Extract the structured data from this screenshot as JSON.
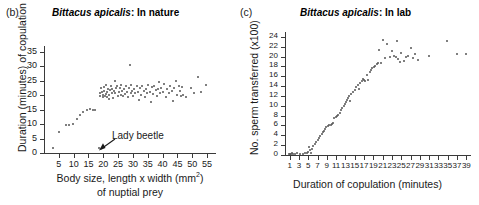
{
  "figure": {
    "background": "#ffffff",
    "point_color": "#555555",
    "axis_color": "#3a3a3a"
  },
  "panels": [
    {
      "letter": "(b)",
      "title_species": "Bittacus apicalis",
      "title_rest": ": In nature",
      "annotation": {
        "label": "Lady beetle",
        "points_to_x": 18.5,
        "points_to_y": 1.8
      }
    },
    {
      "letter": "(c)",
      "title_species": "Bittacus apicalis",
      "title_rest": ": In lab"
    }
  ],
  "chart_data": [
    {
      "type": "scatter",
      "panel": "(b)",
      "title": "Bittacus apicalis: In nature",
      "xlabel": "Body size, length x width (mm2) of nuptial prey",
      "xlabel_line1": "Body size, length x width (mm",
      "xlabel_line1_sup": "2",
      "xlabel_line1_end": ")",
      "xlabel_line2": "of nuptial prey",
      "ylabel": "Duration (minutes) of copulation",
      "xlim": [
        0,
        58
      ],
      "ylim": [
        0,
        37
      ],
      "xticks": [
        5,
        10,
        15,
        20,
        25,
        30,
        35,
        40,
        45,
        50,
        55
      ],
      "yticks": [
        0,
        5,
        10,
        15,
        20,
        25,
        30,
        35
      ],
      "grid": false,
      "legend": "none",
      "points": [
        [
          3.0,
          1.6
        ],
        [
          5.0,
          7.2
        ],
        [
          7.5,
          9.6
        ],
        [
          8.5,
          9.8
        ],
        [
          9.8,
          10.2
        ],
        [
          11.0,
          11.8
        ],
        [
          12.0,
          13.0
        ],
        [
          13.2,
          14.2
        ],
        [
          14.5,
          15.0
        ],
        [
          15.5,
          15.2
        ],
        [
          16.5,
          14.8
        ],
        [
          17.2,
          15.0
        ],
        [
          18.5,
          1.8
        ],
        [
          18.8,
          19.6
        ],
        [
          19.0,
          20.8
        ],
        [
          19.3,
          22.4
        ],
        [
          19.5,
          21.0
        ],
        [
          19.8,
          19.2
        ],
        [
          20.0,
          20.2
        ],
        [
          20.2,
          21.6
        ],
        [
          20.4,
          22.8
        ],
        [
          20.6,
          19.8
        ],
        [
          20.8,
          20.4
        ],
        [
          21.0,
          23.4
        ],
        [
          21.2,
          21.2
        ],
        [
          21.4,
          19.4
        ],
        [
          21.6,
          22.0
        ],
        [
          21.8,
          20.0
        ],
        [
          22.0,
          18.6
        ],
        [
          22.2,
          21.8
        ],
        [
          22.5,
          23.0
        ],
        [
          22.8,
          20.6
        ],
        [
          23.0,
          22.2
        ],
        [
          23.2,
          19.0
        ],
        [
          23.5,
          21.4
        ],
        [
          23.8,
          24.8
        ],
        [
          24.0,
          20.8
        ],
        [
          24.3,
          22.6
        ],
        [
          24.6,
          23.2
        ],
        [
          24.9,
          19.6
        ],
        [
          25.2,
          21.0
        ],
        [
          25.5,
          22.4
        ],
        [
          25.8,
          20.2
        ],
        [
          26.0,
          23.6
        ],
        [
          26.3,
          21.6
        ],
        [
          26.6,
          19.8
        ],
        [
          27.0,
          22.0
        ],
        [
          27.3,
          20.4
        ],
        [
          27.6,
          23.0
        ],
        [
          28.0,
          21.2
        ],
        [
          28.3,
          19.2
        ],
        [
          28.6,
          22.6
        ],
        [
          29.0,
          30.4
        ],
        [
          29.2,
          20.8
        ],
        [
          29.5,
          23.4
        ],
        [
          29.8,
          21.4
        ],
        [
          30.0,
          19.6
        ],
        [
          30.4,
          22.2
        ],
        [
          30.8,
          20.6
        ],
        [
          31.2,
          23.0
        ],
        [
          31.6,
          21.0
        ],
        [
          32.0,
          18.4
        ],
        [
          32.4,
          22.4
        ],
        [
          32.8,
          20.2
        ],
        [
          33.2,
          23.2
        ],
        [
          33.6,
          21.6
        ],
        [
          34.0,
          19.4
        ],
        [
          34.4,
          22.0
        ],
        [
          34.8,
          20.8
        ],
        [
          35.2,
          23.6
        ],
        [
          35.6,
          21.2
        ],
        [
          36.0,
          17.8
        ],
        [
          36.4,
          22.8
        ],
        [
          36.8,
          20.4
        ],
        [
          37.2,
          23.0
        ],
        [
          37.6,
          21.8
        ],
        [
          38.0,
          19.8
        ],
        [
          38.4,
          22.2
        ],
        [
          38.8,
          24.4
        ],
        [
          39.2,
          20.6
        ],
        [
          39.6,
          22.6
        ],
        [
          40.0,
          21.0
        ],
        [
          40.5,
          23.8
        ],
        [
          41.0,
          19.2
        ],
        [
          41.5,
          22.0
        ],
        [
          42.0,
          20.8
        ],
        [
          42.5,
          23.2
        ],
        [
          43.0,
          21.4
        ],
        [
          43.5,
          18.0
        ],
        [
          44.0,
          22.4
        ],
        [
          44.5,
          24.8
        ],
        [
          45.0,
          20.2
        ],
        [
          45.4,
          23.0
        ],
        [
          45.8,
          21.6
        ],
        [
          46.2,
          19.6
        ],
        [
          46.6,
          22.8
        ],
        [
          47.0,
          20.0
        ],
        [
          48.0,
          19.4
        ],
        [
          49.5,
          22.6
        ],
        [
          50.5,
          20.8
        ],
        [
          52.0,
          26.2
        ],
        [
          53.0,
          21.0
        ],
        [
          54.5,
          23.4
        ]
      ]
    },
    {
      "type": "scatter",
      "panel": "(c)",
      "title": "Bittacus apicalis: In lab",
      "xlabel": "Duration of copulation (minutes)",
      "ylabel": "No. sperm transferred (x100)",
      "xlim": [
        0,
        40
      ],
      "ylim": [
        0,
        25
      ],
      "xticks": [
        1,
        3,
        5,
        7,
        9,
        11,
        13,
        15,
        17,
        19,
        21,
        23,
        25,
        27,
        29,
        31,
        33,
        35,
        37,
        39
      ],
      "yticks": [
        0,
        2,
        4,
        6,
        8,
        10,
        12,
        14,
        16,
        18,
        20,
        22,
        24
      ],
      "grid": false,
      "legend": "none",
      "points": [
        [
          0.8,
          0.2
        ],
        [
          1.0,
          0.3
        ],
        [
          1.2,
          0.2
        ],
        [
          1.5,
          0.4
        ],
        [
          1.8,
          0.2
        ],
        [
          2.2,
          0.3
        ],
        [
          2.6,
          0.5
        ],
        [
          3.2,
          0.2
        ],
        [
          3.8,
          0.3
        ],
        [
          4.3,
          0.4
        ],
        [
          4.8,
          0.5
        ],
        [
          5.0,
          0.6
        ],
        [
          5.2,
          1.6
        ],
        [
          5.4,
          1.0
        ],
        [
          5.6,
          0.5
        ],
        [
          5.9,
          1.3
        ],
        [
          6.1,
          1.8
        ],
        [
          6.4,
          2.2
        ],
        [
          6.7,
          2.6
        ],
        [
          7.0,
          3.0
        ],
        [
          7.3,
          3.4
        ],
        [
          7.6,
          3.8
        ],
        [
          7.9,
          4.2
        ],
        [
          8.2,
          4.6
        ],
        [
          8.4,
          4.9
        ],
        [
          8.6,
          5.2
        ],
        [
          8.9,
          5.6
        ],
        [
          9.2,
          5.9
        ],
        [
          9.5,
          6.0
        ],
        [
          9.8,
          6.1
        ],
        [
          10.0,
          6.3
        ],
        [
          10.3,
          6.5
        ],
        [
          10.6,
          7.6
        ],
        [
          10.9,
          7.8
        ],
        [
          11.2,
          8.0
        ],
        [
          11.5,
          8.2
        ],
        [
          11.8,
          8.5
        ],
        [
          12.0,
          9.2
        ],
        [
          12.3,
          9.6
        ],
        [
          12.6,
          10.0
        ],
        [
          12.9,
          10.4
        ],
        [
          13.1,
          10.8
        ],
        [
          13.3,
          11.2
        ],
        [
          13.5,
          11.6
        ],
        [
          13.8,
          12.0
        ],
        [
          14.0,
          11.0
        ],
        [
          14.3,
          12.4
        ],
        [
          14.6,
          12.8
        ],
        [
          15.0,
          13.2
        ],
        [
          15.3,
          13.8
        ],
        [
          15.6,
          14.2
        ],
        [
          15.9,
          13.4
        ],
        [
          16.2,
          14.6
        ],
        [
          16.5,
          15.0
        ],
        [
          16.8,
          15.4
        ],
        [
          17.0,
          15.2
        ],
        [
          17.3,
          15.0
        ],
        [
          17.6,
          16.2
        ],
        [
          17.9,
          15.2
        ],
        [
          18.2,
          16.8
        ],
        [
          18.5,
          17.2
        ],
        [
          18.8,
          17.6
        ],
        [
          19.1,
          17.8
        ],
        [
          19.4,
          18.0
        ],
        [
          19.7,
          18.4
        ],
        [
          20.0,
          18.6
        ],
        [
          20.3,
          21.4
        ],
        [
          20.6,
          18.8
        ],
        [
          21.0,
          23.4
        ],
        [
          21.5,
          19.8
        ],
        [
          22.0,
          22.6
        ],
        [
          22.5,
          20.0
        ],
        [
          23.0,
          21.2
        ],
        [
          23.5,
          20.2
        ],
        [
          23.8,
          20.0
        ],
        [
          24.0,
          23.2
        ],
        [
          24.4,
          19.6
        ],
        [
          24.8,
          19.0
        ],
        [
          25.0,
          20.8
        ],
        [
          25.5,
          19.2
        ],
        [
          26.0,
          20.0
        ],
        [
          26.5,
          20.2
        ],
        [
          27.0,
          21.8
        ],
        [
          27.5,
          19.8
        ],
        [
          28.0,
          20.6
        ],
        [
          28.6,
          19.4
        ],
        [
          31.0,
          20.2
        ],
        [
          34.8,
          23.2
        ],
        [
          37.0,
          20.6
        ],
        [
          39.0,
          20.6
        ]
      ]
    }
  ]
}
